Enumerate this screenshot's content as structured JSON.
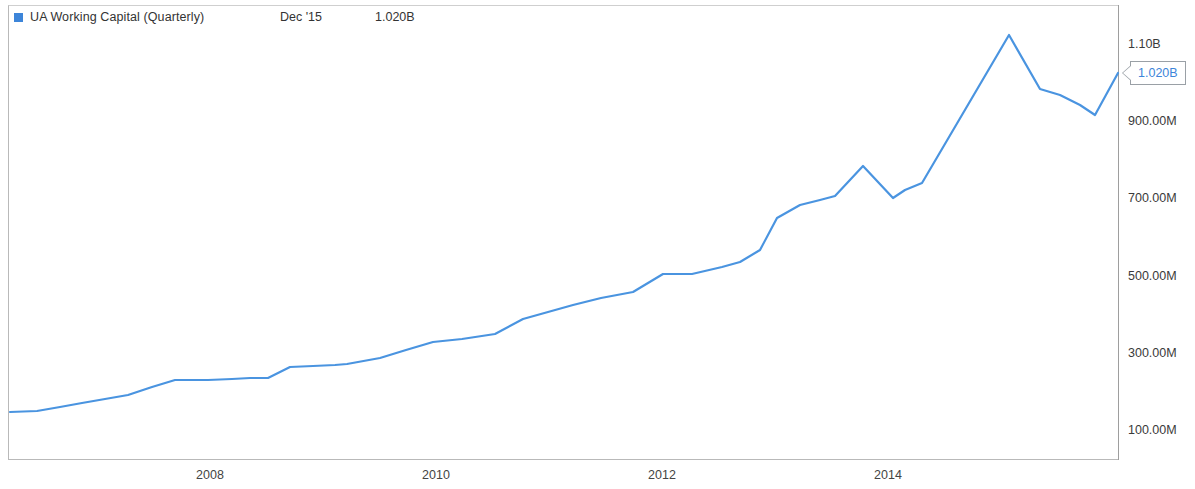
{
  "legend": {
    "series_label": "UA Working Capital (Quarterly)",
    "date_label": "Dec '15",
    "value_label": "1.020B",
    "swatch_color": "#3d85d9"
  },
  "callout": {
    "value": "1.020B",
    "text_color": "#3d85d9",
    "border_color": "#9aa0a6"
  },
  "axis": {
    "y_ticks": [
      "1.10B",
      "900.00M",
      "700.00M",
      "500.00M",
      "300.00M",
      "100.00M"
    ],
    "x_ticks": [
      "2008",
      "2010",
      "2012",
      "2014"
    ]
  },
  "chart_data": {
    "type": "line",
    "title": "UA Working Capital (Quarterly)",
    "xlabel": "",
    "ylabel": "",
    "series_name": "UA Working Capital (Quarterly)",
    "line_color": "#4a94e0",
    "grid": false,
    "legend_position": "top-left",
    "y_axis_position": "right",
    "ylim": [
      60000000,
      1160000000
    ],
    "ytick_values": [
      1100000000,
      900000000,
      700000000,
      500000000,
      300000000,
      100000000
    ],
    "ytick_labels": [
      "1.10B",
      "900.00M",
      "700.00M",
      "500.00M",
      "300.00M",
      "100.00M"
    ],
    "xlim": [
      "2006-03",
      "2015-12"
    ],
    "xtick_labels": [
      "2008",
      "2010",
      "2012",
      "2014"
    ],
    "last_point_label": "1.020B",
    "last_point_date": "Dec '15",
    "units": "USD",
    "x": [
      "2006-03",
      "2006-06",
      "2006-09",
      "2006-12",
      "2007-03",
      "2007-06",
      "2007-09",
      "2007-12",
      "2008-03",
      "2008-06",
      "2008-09",
      "2008-12",
      "2009-03",
      "2009-06",
      "2009-09",
      "2009-12",
      "2010-03",
      "2010-06",
      "2010-09",
      "2010-12",
      "2011-03",
      "2011-06",
      "2011-09",
      "2011-12",
      "2012-03",
      "2012-06",
      "2012-09",
      "2012-12",
      "2013-03",
      "2013-06",
      "2013-09",
      "2013-12",
      "2014-03",
      "2014-06",
      "2014-09",
      "2014-12",
      "2015-03",
      "2015-06",
      "2015-09",
      "2015-12"
    ],
    "values": [
      148000000,
      149000000,
      156000000,
      165000000,
      172000000,
      180000000,
      196000000,
      209000000,
      232000000,
      235000000,
      236000000,
      244000000,
      259000000,
      261000000,
      262000000,
      266000000,
      281000000,
      296000000,
      330000000,
      338000000,
      340000000,
      356000000,
      376000000,
      400000000,
      425000000,
      448000000,
      468000000,
      483000000,
      504000000,
      508000000,
      520000000,
      575000000,
      630000000,
      665000000,
      686000000,
      765000000,
      695000000,
      718000000,
      790000000,
      1020000000
    ],
    "points_px": [
      [
        10,
        412
      ],
      [
        37,
        411
      ],
      [
        60,
        407
      ],
      [
        82,
        403
      ],
      [
        105,
        399
      ],
      [
        128,
        395
      ],
      [
        152,
        387
      ],
      [
        175,
        380
      ],
      [
        208,
        380
      ],
      [
        232,
        379
      ],
      [
        250,
        378
      ],
      [
        268,
        378
      ],
      [
        290,
        367
      ],
      [
        313,
        366
      ],
      [
        335,
        365
      ],
      [
        347,
        364
      ],
      [
        380,
        358
      ],
      [
        406,
        350
      ],
      [
        433,
        342
      ],
      [
        462,
        339
      ],
      [
        495,
        334
      ],
      [
        523,
        319
      ],
      [
        548,
        312
      ],
      [
        573,
        305
      ],
      [
        601,
        298
      ],
      [
        633,
        292
      ],
      [
        663,
        274
      ],
      [
        692,
        274
      ],
      [
        722,
        267
      ],
      [
        740,
        262
      ],
      [
        760,
        250
      ],
      [
        777,
        218
      ],
      [
        800,
        205
      ],
      [
        820,
        200
      ],
      [
        835,
        196
      ],
      [
        863,
        166
      ],
      [
        893,
        198
      ],
      [
        905,
        190
      ],
      [
        922,
        183
      ],
      [
        1009,
        35
      ],
      [
        1040,
        89
      ],
      [
        1060,
        95
      ],
      [
        1080,
        105
      ],
      [
        1095,
        115
      ],
      [
        1118,
        73
      ]
    ]
  }
}
